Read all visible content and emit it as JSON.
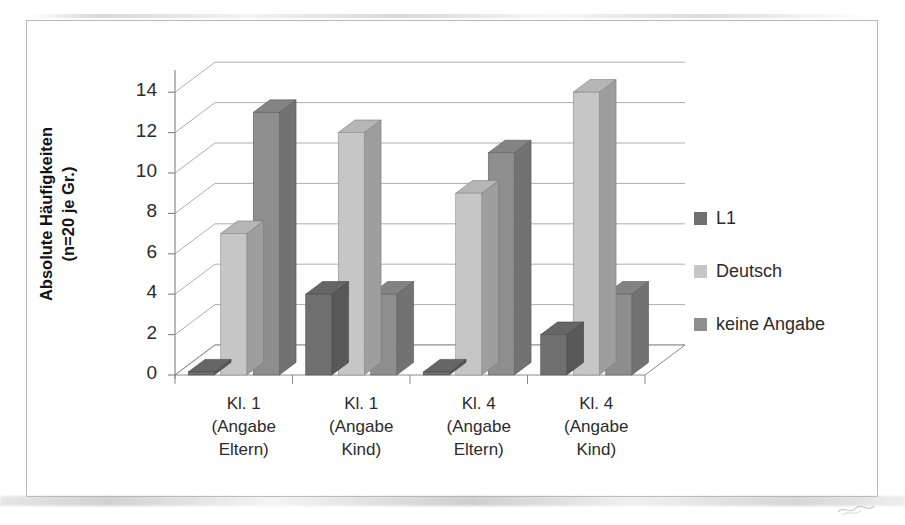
{
  "chart_data": {
    "type": "bar",
    "title": "",
    "subtitle": "",
    "xlabel": "",
    "ylabel": "Absolute Häufigkeiten (n=20 je Gr.)",
    "ylabel_line1": "Absolute Häufigkeiten",
    "ylabel_line2": "(n=20 je Gr.)",
    "categories": [
      "Kl. 1 (Angabe Eltern)",
      "Kl. 1 (Angabe Kind)",
      "Kl. 4 (Angabe Eltern)",
      "Kl. 4 (Angabe Kind)"
    ],
    "category_lines": [
      [
        "Kl. 1",
        "(Angabe",
        "Eltern)"
      ],
      [
        "Kl. 1",
        "(Angabe",
        "Kind)"
      ],
      [
        "Kl. 4",
        "(Angabe",
        "Eltern)"
      ],
      [
        "Kl. 4",
        "(Angabe",
        "Kind)"
      ]
    ],
    "series": [
      {
        "name": "L1",
        "color": "#6f6f6f",
        "values": [
          0,
          4,
          0,
          2
        ]
      },
      {
        "name": "Deutsch",
        "color": "#c6c6c6",
        "values": [
          7,
          12,
          9,
          14
        ]
      },
      {
        "name": "keine Angabe",
        "color": "#8e8e8e",
        "values": [
          13,
          4,
          11,
          4
        ]
      }
    ],
    "ylim": [
      0,
      15
    ],
    "yticks": [
      0,
      2,
      4,
      6,
      8,
      10,
      12,
      14
    ],
    "ytick_labels": [
      "0",
      "2",
      "4",
      "6",
      "8",
      "10",
      "12",
      "14"
    ],
    "grid": true,
    "grid_axis": "y",
    "legend_position": "right",
    "style": "3d-clustered-column",
    "plot_bgcolor": "#ffffff",
    "grid_color": "#9a9a9a",
    "axis_color": "#8a8a8a",
    "frame_color": "#b9b9b9",
    "text_color": "#2b2b2b"
  },
  "legend": {
    "items": [
      {
        "label": "L1",
        "color": "#6f6f6f"
      },
      {
        "label": "Deutsch",
        "color": "#c6c6c6"
      },
      {
        "label": "keine Angabe",
        "color": "#8e8e8e"
      }
    ]
  }
}
